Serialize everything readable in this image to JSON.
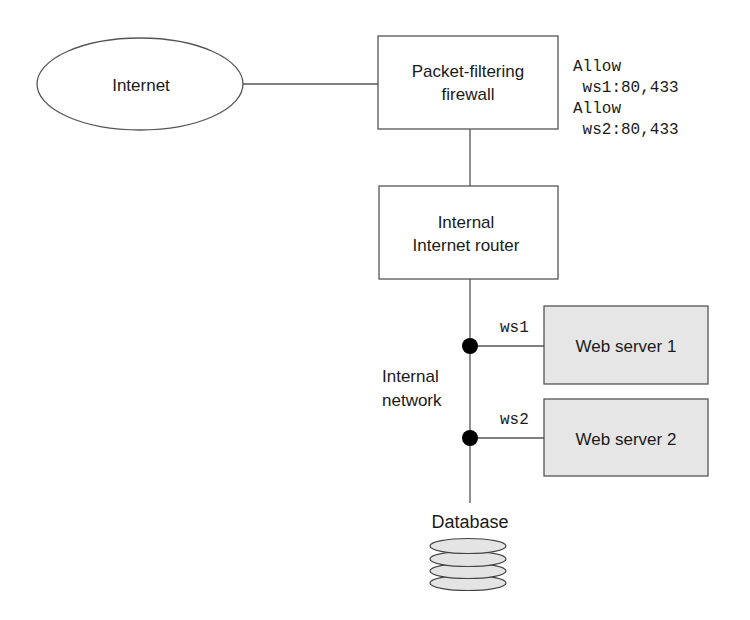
{
  "diagram": {
    "nodes": {
      "internet": {
        "label": "Internet"
      },
      "firewall": {
        "label_lines": [
          "Packet-filtering",
          "firewall"
        ]
      },
      "router": {
        "label_lines": [
          "Internal",
          "Internet router"
        ]
      },
      "web_server_1": {
        "label": "Web server 1",
        "link_label": "ws1"
      },
      "web_server_2": {
        "label": "Web server 2",
        "link_label": "ws2"
      },
      "database": {
        "label": "Database"
      }
    },
    "network_label_lines": [
      "Internal",
      "network"
    ],
    "firewall_rules": [
      "Allow",
      " ws1:80,433",
      "Allow",
      " ws2:80,433"
    ],
    "colors": {
      "stroke": "#555555",
      "server_fill": "#e6e6e6",
      "disk_fill": "#e4e4e4",
      "junction": "#000000"
    }
  }
}
